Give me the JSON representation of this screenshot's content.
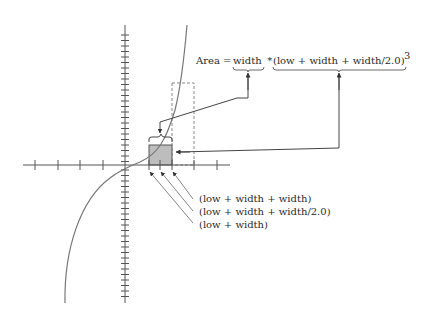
{
  "formula": {
    "prefix": "Area = ",
    "term_width": "width",
    "operator": " * ",
    "term_height": "(low + width + width/2.0)",
    "exponent": "3"
  },
  "annotations": [
    {
      "label": "(low + width + width)"
    },
    {
      "label": "(low + width + width/2.0)"
    },
    {
      "label": "(low + width)"
    }
  ],
  "colors": {
    "axis": "#555555",
    "curve": "#777777",
    "shaded_rect": "#bdbdbd",
    "dashed_rect": "#888888",
    "arrow": "#444444",
    "text": "#2a2a2a"
  },
  "plot": {
    "function": "cubic curve y = x^3",
    "shaded_interval": "[low + width, low + width + width]",
    "midpoint": "low + width + width/2.0"
  }
}
